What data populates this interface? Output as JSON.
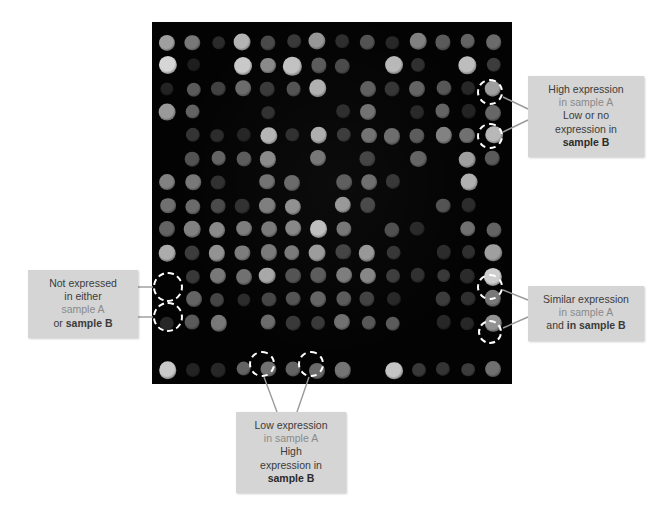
{
  "figure": {
    "type": "microarray-expression-diagram",
    "panel": {
      "name": "microarray-grid",
      "background_color": "#030303",
      "columns": 14,
      "rows": 15,
      "spot_diameter_px": 17,
      "col_spacing_px": 25.0,
      "row_spacing_px": 23.4,
      "origin_x_px": 16,
      "origin_y_px": 20
    },
    "callout_style": {
      "background_color": "#d5d5d5",
      "text_color": "#3b3b3b",
      "bold_text_color": "#2b2b2b",
      "muted_text_color": "#8a8a8a",
      "circle_color": "#ffffff",
      "connector_color": "#9a9a9a"
    }
  },
  "chart_data": {
    "type": "heatmap",
    "title": "",
    "xlabel": "",
    "ylabel": "",
    "legend": [],
    "grid": false,
    "columns": 14,
    "rows": 15,
    "value_range": [
      0,
      100
    ],
    "values": [
      [
        62,
        44,
        8,
        72,
        22,
        14,
        58,
        9,
        26,
        6,
        48,
        30,
        34,
        38
      ],
      [
        88,
        2,
        0,
        82,
        52,
        78,
        30,
        22,
        0,
        74,
        10,
        0,
        76,
        16
      ],
      [
        4,
        30,
        18,
        38,
        14,
        26,
        70,
        0,
        32,
        12,
        34,
        28,
        6,
        62
      ],
      [
        60,
        34,
        0,
        0,
        10,
        0,
        0,
        8,
        40,
        0,
        6,
        34,
        4,
        36
      ],
      [
        0,
        12,
        8,
        4,
        72,
        9,
        68,
        14,
        40,
        38,
        30,
        48,
        40,
        74
      ],
      [
        0,
        26,
        34,
        30,
        52,
        0,
        42,
        0,
        18,
        0,
        34,
        0,
        62,
        30
      ],
      [
        48,
        44,
        10,
        0,
        40,
        36,
        0,
        30,
        38,
        12,
        0,
        0,
        70,
        0
      ],
      [
        40,
        38,
        22,
        10,
        46,
        54,
        0,
        58,
        20,
        0,
        0,
        26,
        8,
        0
      ],
      [
        34,
        48,
        52,
        46,
        44,
        50,
        76,
        42,
        0,
        24,
        6,
        0,
        40,
        34
      ],
      [
        68,
        16,
        56,
        46,
        44,
        44,
        60,
        18,
        58,
        12,
        0,
        8,
        10,
        62
      ],
      [
        0,
        14,
        44,
        40,
        66,
        26,
        30,
        46,
        50,
        16,
        10,
        14,
        8,
        84
      ],
      [
        0,
        34,
        20,
        8,
        20,
        26,
        34,
        30,
        18,
        6,
        0,
        16,
        10,
        44
      ],
      [
        6,
        30,
        44,
        0,
        38,
        14,
        14,
        40,
        28,
        30,
        0,
        6,
        6,
        56
      ],
      [
        0,
        0,
        0,
        0,
        0,
        0,
        0,
        0,
        0,
        0,
        0,
        0,
        0,
        0
      ],
      [
        82,
        4,
        6,
        34,
        40,
        34,
        38,
        42,
        0,
        80,
        14,
        12,
        16,
        40
      ]
    ]
  },
  "highlights": [
    {
      "name": "highlight-high-1",
      "cx": 490,
      "cy": 92,
      "d": 26
    },
    {
      "name": "highlight-high-2",
      "cx": 490,
      "cy": 136,
      "d": 26
    },
    {
      "name": "highlight-none-1",
      "cx": 168,
      "cy": 287,
      "d": 30
    },
    {
      "name": "highlight-none-2",
      "cx": 168,
      "cy": 317,
      "d": 30
    },
    {
      "name": "highlight-similar-1",
      "cx": 490,
      "cy": 287,
      "d": 26
    },
    {
      "name": "highlight-similar-2",
      "cx": 490,
      "cy": 332,
      "d": 24
    },
    {
      "name": "highlight-low-1",
      "cx": 262,
      "cy": 364,
      "d": 26
    },
    {
      "name": "highlight-low-2",
      "cx": 311,
      "cy": 364,
      "d": 26
    }
  ],
  "connectors": [
    {
      "name": "connector-high-1",
      "x1": 503,
      "y1": 97,
      "x2": 528,
      "y2": 109
    },
    {
      "name": "connector-high-2",
      "x1": 503,
      "y1": 132,
      "x2": 528,
      "y2": 120
    },
    {
      "name": "connector-none-1",
      "x1": 153,
      "y1": 287,
      "x2": 138,
      "y2": 287
    },
    {
      "name": "connector-none-2",
      "x1": 153,
      "y1": 317,
      "x2": 138,
      "y2": 317
    },
    {
      "name": "connector-similar-1",
      "x1": 503,
      "y1": 290,
      "x2": 528,
      "y2": 300
    },
    {
      "name": "connector-similar-2",
      "x1": 503,
      "y1": 328,
      "x2": 528,
      "y2": 317
    },
    {
      "name": "connector-low-1",
      "x1": 264,
      "y1": 377,
      "x2": 277,
      "y2": 412
    },
    {
      "name": "connector-low-2",
      "x1": 309,
      "y1": 377,
      "x2": 297,
      "y2": 412
    }
  ],
  "callouts": {
    "high": {
      "name": "callout-high-expression",
      "lines": [
        {
          "text": "High expression",
          "style": "normal"
        },
        {
          "text": "in sample A",
          "style": "muted"
        },
        {
          "text": "Low or no",
          "style": "normal"
        },
        {
          "text": "expression in",
          "style": "normal"
        },
        {
          "text": "sample B",
          "style": "bold"
        }
      ]
    },
    "none": {
      "name": "callout-not-expressed",
      "lines": [
        {
          "text": "Not expressed",
          "style": "normal"
        },
        {
          "text": "in either",
          "style": "normal"
        },
        {
          "text": "sample A",
          "style": "muted"
        },
        {
          "text": "or sample B",
          "style": "mixed-bold-tail",
          "prefix": "or ",
          "bold": "sample B"
        }
      ]
    },
    "similar": {
      "name": "callout-similar-expression",
      "lines": [
        {
          "text": "Similar expression",
          "style": "normal"
        },
        {
          "text": "in sample A",
          "style": "muted"
        },
        {
          "text": "and in sample B",
          "style": "mixed-bold-tail",
          "prefix": "and ",
          "bold": "in sample B"
        }
      ]
    },
    "low": {
      "name": "callout-low-expression",
      "lines": [
        {
          "text": "Low expression",
          "style": "normal"
        },
        {
          "text": "in sample A",
          "style": "muted"
        },
        {
          "text": "High",
          "style": "normal"
        },
        {
          "text": "expression in",
          "style": "normal"
        },
        {
          "text": "sample B",
          "style": "bold"
        }
      ]
    }
  }
}
